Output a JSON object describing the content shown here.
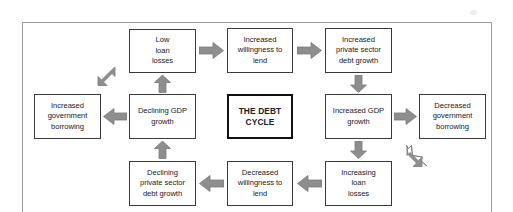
{
  "figure": {
    "title": "The Debt Cycle",
    "frame": {
      "border_color": "#9a9a9a"
    },
    "arrow_color": "#8e8e8e",
    "box_border_color": "#3a3a3a",
    "center_border_color": "#111111",
    "text_color": "#20201f"
  },
  "center": {
    "label": "THE DEBT\nCYCLE"
  },
  "nodes": [
    {
      "id": "low-loan-losses",
      "label": "Low\nloan\nlosses"
    },
    {
      "id": "increased-willingness",
      "label": "Increased\nwillingness to\nlend"
    },
    {
      "id": "increased-private-debt",
      "label": "Increased\nprivate sector\ndebt growth"
    },
    {
      "id": "increased-gdp-growth",
      "label": "Increased GDP\ngrowth"
    },
    {
      "id": "decreased-gov-borrowing",
      "label": "Decreased\ngovernment\nborrowing"
    },
    {
      "id": "increasing-loan-losses",
      "label": "Increasing\nloan\nlosses"
    },
    {
      "id": "decreased-willingness",
      "label": "Decreased\nwillingness to\nlend"
    },
    {
      "id": "declining-private-debt",
      "label": "Declining\nprivate sector\ndebt growth"
    },
    {
      "id": "declining-gdp-growth",
      "label": "Declining GDP\ngrowth"
    },
    {
      "id": "increased-gov-borrowing",
      "label": "Increased\ngovernment\nborrowing"
    }
  ],
  "arrows": [
    {
      "id": "low-losses-to-willingness",
      "direction": "right"
    },
    {
      "id": "willingness-to-private-debt",
      "direction": "right"
    },
    {
      "id": "private-debt-to-gdp-growth",
      "direction": "down"
    },
    {
      "id": "gdp-growth-to-gov-borrowing",
      "direction": "right"
    },
    {
      "id": "gov-borrowing-to-loan-losses",
      "direction": "up-left"
    },
    {
      "id": "gdp-growth-to-loan-losses",
      "direction": "down"
    },
    {
      "id": "loan-losses-to-willingness-down",
      "direction": "left"
    },
    {
      "id": "willingness-down-to-private-decline",
      "direction": "left"
    },
    {
      "id": "private-decline-to-gdp-decline",
      "direction": "up"
    },
    {
      "id": "gdp-decline-to-gov-borrowing-up",
      "direction": "left"
    },
    {
      "id": "gov-borrowing-up-to-low-losses",
      "direction": "up-right"
    },
    {
      "id": "gdp-decline-to-low-losses",
      "direction": "up"
    }
  ]
}
